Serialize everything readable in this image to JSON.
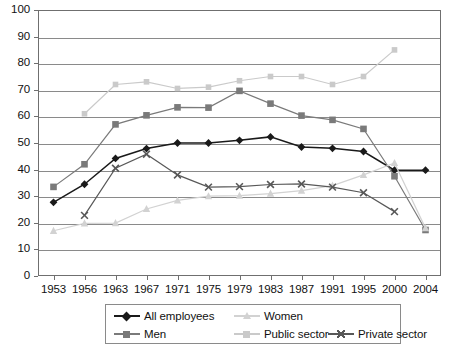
{
  "chart_data": {
    "type": "line",
    "title": "",
    "subtitle": "",
    "xlabel": "",
    "ylabel": "",
    "categories": [
      "1953",
      "1956",
      "1963",
      "1967",
      "1971",
      "1975",
      "1979",
      "1983",
      "1987",
      "1991",
      "1995",
      "2000",
      "2004"
    ],
    "ylim": [
      0,
      100
    ],
    "ytick_step": 10,
    "yticks": [
      "0",
      "10",
      "20",
      "30",
      "40",
      "50",
      "60",
      "70",
      "80",
      "90",
      "100"
    ],
    "grid": true,
    "legend_position": "bottom",
    "series": [
      {
        "name": "All employees",
        "marker": "diamond",
        "color": "#1a1a1a",
        "values": [
          27.7,
          34.5,
          44.2,
          47.9,
          50.0,
          50.0,
          51.0,
          52.3,
          48.5,
          48.0,
          46.8,
          39.8,
          39.8
        ]
      },
      {
        "name": "Men",
        "marker": "square",
        "color": "#7a7a7a",
        "values": [
          33.5,
          42.0,
          57.0,
          60.4,
          63.4,
          63.3,
          69.6,
          64.8,
          60.3,
          58.7,
          55.3,
          37.5,
          17.3
        ]
      },
      {
        "name": "Women",
        "marker": "triangle",
        "color": "#d2d2d2",
        "values": [
          17.0,
          19.8,
          19.9,
          25.2,
          28.4,
          30.0,
          30.2,
          31.0,
          32.1,
          34.0,
          38.0,
          42.5,
          18.0
        ]
      },
      {
        "name": "Public sector",
        "marker": "square-small",
        "color": "#cacaca",
        "values": [
          null,
          61.0,
          72.0,
          73.0,
          70.5,
          71.0,
          73.4,
          75.0,
          75.0,
          72.0,
          75.0,
          85.0,
          null
        ]
      },
      {
        "name": "Private sector",
        "marker": "x",
        "color": "#585858",
        "values": [
          null,
          22.8,
          40.5,
          45.8,
          38.0,
          33.4,
          33.6,
          34.4,
          34.6,
          33.4,
          31.3,
          24.2,
          null
        ]
      }
    ]
  },
  "legend": {
    "entries": [
      {
        "label": "All employees",
        "marker": "diamond",
        "color": "#1a1a1a"
      },
      {
        "label": "Women",
        "marker": "triangle",
        "color": "#d2d2d2"
      },
      {
        "label": "Men",
        "marker": "square",
        "color": "#7a7a7a"
      },
      {
        "label": "Public sector",
        "marker": "square-small",
        "color": "#cacaca"
      },
      {
        "label": "Private sector",
        "marker": "x",
        "color": "#585858"
      }
    ]
  },
  "colors": {
    "axis": "#6f6f6f",
    "grid": "#8a8a8a",
    "background": "#ffffff",
    "text": "#111111"
  }
}
